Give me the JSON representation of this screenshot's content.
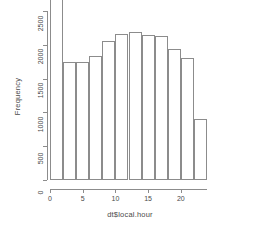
{
  "chart_data": {
    "type": "bar",
    "title": "",
    "subtitle": "",
    "xlabel": "dt$local.hour",
    "ylabel": "Frequency",
    "grid": false,
    "legend": null,
    "xlim": [
      0,
      24
    ],
    "ylim": [
      0,
      2700
    ],
    "bin_width": 2,
    "bin_edges": [
      0,
      2,
      4,
      6,
      8,
      10,
      12,
      14,
      16,
      18,
      20,
      22,
      24
    ],
    "categories": [
      "0-2",
      "2-4",
      "4-6",
      "6-8",
      "8-10",
      "10-12",
      "12-14",
      "14-16",
      "16-18",
      "18-20",
      "20-22",
      "22-24"
    ],
    "values": [
      2680,
      1750,
      1750,
      1830,
      2060,
      2160,
      2190,
      2150,
      2130,
      1940,
      1800,
      900
    ],
    "x_tick_values": [
      0,
      5,
      10,
      15,
      20
    ],
    "x_tick_labels": [
      "0",
      "5",
      "10",
      "15",
      "20"
    ],
    "y_tick_values": [
      0,
      500,
      1000,
      1500,
      2000,
      2500
    ],
    "y_tick_labels": [
      "0",
      "500",
      "1000",
      "1500",
      "2000",
      "2500"
    ],
    "bar_fill": "#ffffff",
    "bar_border": "#8c8c8c",
    "axis_color": "#8c8c8c",
    "text_color": "#4a4a4a",
    "background": "#ffffff"
  }
}
